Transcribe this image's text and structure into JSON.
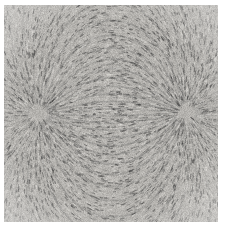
{
  "figure": {
    "kind": "iron-filings-magnetic-field-photograph",
    "caption": "",
    "title": "",
    "width": 225,
    "height": 233,
    "background_color": "#ffffff"
  },
  "plate": {
    "label": "filings-plate",
    "x": 4,
    "y": 5,
    "width": 214,
    "height": 217,
    "base_color": "#9e9e9e",
    "paper_tint": "#b4b2ae",
    "filing_dark_color": "#3a3a3a",
    "filing_light_color": "#d8d6d2",
    "corner_light_color": "#cfcdc8"
  },
  "poles": [
    {
      "label": "left-pole",
      "polarity": "north",
      "cx": 39,
      "cy": 114,
      "radius": 9,
      "core_color": "#2b2b2b",
      "halo_color": "#585858"
    },
    {
      "label": "right-pole",
      "polarity": "south",
      "cx": 185,
      "cy": 113,
      "radius": 9,
      "core_color": "#2b2b2b",
      "halo_color": "#585858"
    }
  ],
  "field": {
    "description": "dipole field lines arcing between two opposite poles",
    "line_count": 46,
    "filing_count": 5200,
    "filing_length_min": 2.0,
    "filing_length_max": 5.5,
    "axis_y": 113.5,
    "seed": 20240917
  },
  "chart_data": {
    "type": "scatter",
    "title": "",
    "xlabel": "",
    "ylabel": "",
    "xlim": [
      4,
      218
    ],
    "ylim": [
      5,
      222
    ],
    "grid": false,
    "legend_position": "none",
    "series": [
      {
        "name": "left pole (north)",
        "x": [
          39
        ],
        "y": [
          114
        ]
      },
      {
        "name": "right pole (south)",
        "x": [
          185
        ],
        "y": [
          113
        ]
      }
    ],
    "annotations": [
      "iron filings align along dipole field lines",
      "dense dark clusters mark the two pole positions",
      "strongest horizontal alignment on the axis between poles",
      "lines arc above and below, returning pole to pole",
      "filing density falls off toward the plate corners"
    ]
  }
}
